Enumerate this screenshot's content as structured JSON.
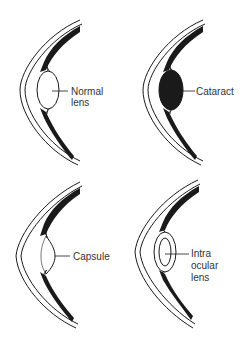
{
  "diagram": {
    "title": "",
    "panels": [
      {
        "id": "normal",
        "position": "top-left",
        "label_lines": [
          "Normal",
          "lens"
        ],
        "lens_type": "clear-biconvex"
      },
      {
        "id": "cataract",
        "position": "top-right",
        "label_lines": [
          "Cataract"
        ],
        "lens_type": "opaque-biconvex"
      },
      {
        "id": "capsule",
        "position": "bottom-left",
        "label_lines": [
          "Capsule"
        ],
        "lens_type": "empty-capsule"
      },
      {
        "id": "iol",
        "position": "bottom-right",
        "label_lines": [
          "Intra",
          "ocular",
          "lens"
        ],
        "lens_type": "implant-in-capsule"
      }
    ],
    "colors": {
      "ink": "#1a1a1a",
      "label": "#333333",
      "background": "#ffffff"
    }
  }
}
